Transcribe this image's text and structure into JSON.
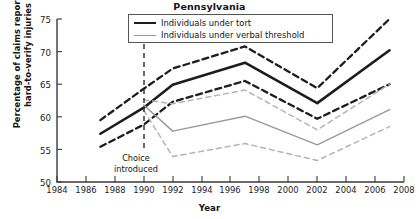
{
  "chart_data": {
    "type": "line",
    "title": "Pennsylvania",
    "xlabel": "Year",
    "ylabel_line1": "Percentage of claims reporting",
    "ylabel_line2": "hard-to-verify injuries",
    "xlim": [
      1984,
      2008
    ],
    "ylim": [
      50,
      75
    ],
    "xticks": [
      1984,
      1986,
      1988,
      1990,
      1992,
      1994,
      1996,
      1998,
      2000,
      2002,
      2004,
      2006,
      2008
    ],
    "yticks": [
      50,
      55,
      60,
      65,
      70,
      75
    ],
    "grid": false,
    "legend_position": "top-center",
    "annotations": [
      {
        "name": "choice-introduced",
        "text_line1": "Choice",
        "text_line2": "introduced",
        "x": 1990,
        "style": "vertical-dashed-line"
      }
    ],
    "series": [
      {
        "name": "Individuals under tort",
        "style": "solid",
        "color": "#1d1d1d",
        "legend": true,
        "x": [
          1987,
          1990,
          1992,
          1997,
          2002,
          2007
        ],
        "values": [
          57.4,
          61.4,
          64.9,
          68.3,
          62.1,
          70.2
        ]
      },
      {
        "name": "Individuals under tort — upper bound",
        "style": "dashed",
        "color": "#1d1d1d",
        "legend": false,
        "x": [
          1987,
          1990,
          1992,
          1997,
          2002,
          2007
        ],
        "values": [
          59.5,
          64.3,
          67.4,
          70.8,
          64.4,
          75.0
        ]
      },
      {
        "name": "Individuals under tort — lower bound",
        "style": "dashed",
        "color": "#1d1d1d",
        "legend": false,
        "x": [
          1987,
          1990,
          1992,
          1997,
          2002,
          2007
        ],
        "values": [
          55.4,
          58.8,
          62.3,
          65.5,
          59.7,
          65.0
        ]
      },
      {
        "name": "Individuals under verbal threshold",
        "style": "solid",
        "color": "#9a9a9a",
        "legend": true,
        "x": [
          1990,
          1992,
          1997,
          2002,
          2007
        ],
        "values": [
          61.8,
          57.8,
          60.1,
          55.7,
          61.1
        ]
      },
      {
        "name": "Individuals under verbal threshold — upper bound",
        "style": "dashed",
        "color": "#b4b4b4",
        "legend": false,
        "x": [
          1990,
          1992,
          1997,
          2002,
          2007
        ],
        "values": [
          62.6,
          62.0,
          64.1,
          58.0,
          65.0
        ]
      },
      {
        "name": "Individuals under verbal threshold — lower bound",
        "style": "dashed",
        "color": "#b4b4b4",
        "legend": false,
        "x": [
          1990,
          1992,
          1997,
          2002,
          2007
        ],
        "values": [
          61.0,
          53.9,
          55.9,
          53.3,
          58.5
        ]
      }
    ]
  },
  "legend": {
    "items": [
      {
        "label": "Individuals under tort"
      },
      {
        "label": "Individuals under verbal threshold"
      }
    ]
  }
}
